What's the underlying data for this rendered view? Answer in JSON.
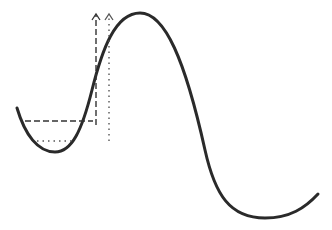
{
  "diagram": {
    "type": "energy-landscape",
    "colors": {
      "curve": "#2a2a2a",
      "dashed": "#333333",
      "dotted": "#555555",
      "background": "#ffffff"
    },
    "curve": {
      "start": [
        17,
        108
      ],
      "left_min": [
        55,
        152
      ],
      "peak": [
        140,
        13
      ],
      "right_min": [
        265,
        218
      ],
      "end": [
        318,
        194
      ]
    },
    "levels": [
      {
        "name": "dashed-level",
        "style": "dashed",
        "y": 121,
        "x_start": 25,
        "x_end": 96,
        "arrow_x": 96,
        "arrow_top": 13
      },
      {
        "name": "dotted-level",
        "style": "dotted",
        "y": 141,
        "x_start": 37,
        "x_end": 72,
        "arrow_x": 109,
        "arrow_top": 13,
        "arrow_bottom": 141
      }
    ]
  }
}
